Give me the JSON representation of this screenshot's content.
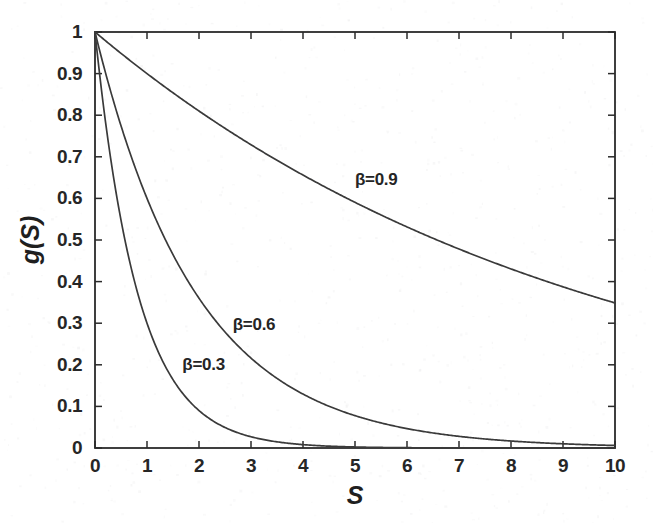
{
  "chart_data": {
    "type": "line",
    "title": "",
    "xlabel": "S",
    "ylabel": "g(S)",
    "xlim": [
      0,
      10
    ],
    "ylim": [
      0,
      1
    ],
    "grid": false,
    "legend_position": "inline-annotations",
    "x_ticks": [
      "0",
      "1",
      "2",
      "3",
      "4",
      "5",
      "6",
      "7",
      "8",
      "9",
      "10"
    ],
    "y_ticks": [
      "0",
      "0.1",
      "0.2",
      "0.3",
      "0.4",
      "0.5",
      "0.6",
      "0.7",
      "0.8",
      "0.9",
      "1"
    ],
    "x": [
      0,
      1,
      2,
      3,
      4,
      5,
      6,
      7,
      8,
      9,
      10
    ],
    "series": [
      {
        "name": "β=0.9",
        "beta": 0.9,
        "label": "β=0.9",
        "label_x": 5.0,
        "label_y": 0.645,
        "values": [
          1,
          0.9,
          0.81,
          0.729,
          0.6561,
          0.5905,
          0.5314,
          0.4783,
          0.4305,
          0.3874,
          0.3487
        ]
      },
      {
        "name": "β=0.6",
        "beta": 0.6,
        "label": "β=0.6",
        "label_x": 2.65,
        "label_y": 0.295,
        "values": [
          1,
          0.6,
          0.36,
          0.216,
          0.1296,
          0.0778,
          0.0467,
          0.028,
          0.0168,
          0.0101,
          0.006
        ]
      },
      {
        "name": "β=0.3",
        "beta": 0.3,
        "label": "β=0.3",
        "label_x": 1.68,
        "label_y": 0.2,
        "values": [
          1,
          0.3,
          0.09,
          0.027,
          0.0081,
          0.0024,
          0.0007,
          0.0002,
          0.0001,
          0,
          0
        ]
      }
    ]
  },
  "axes": {
    "x_title": "S",
    "y_title": "g(S)"
  }
}
